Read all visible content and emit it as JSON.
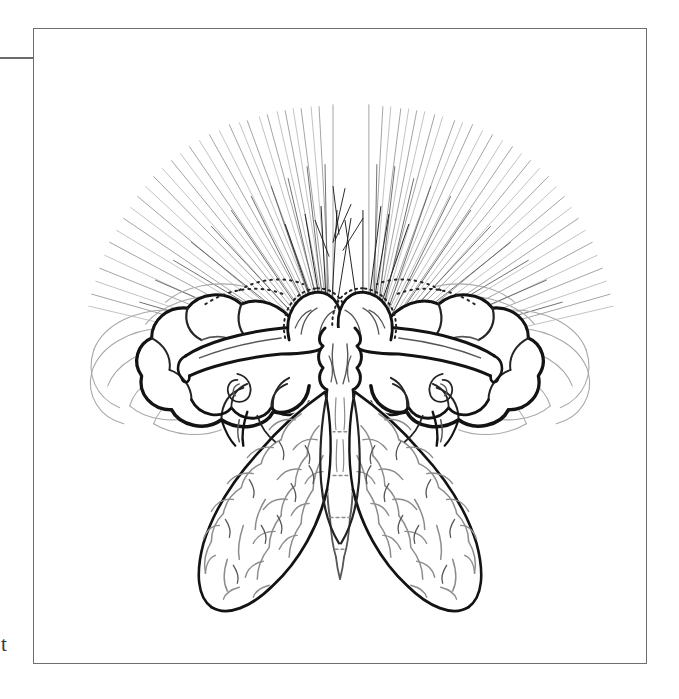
{
  "page": {
    "background_color": "#ffffff",
    "width": 679,
    "height": 699,
    "kind": "scanned-document-page"
  },
  "margin": {
    "rule_color": "#6b6b6b",
    "text_fragment": "t"
  },
  "figure": {
    "frame_color": "#6e6e6e",
    "frame_background": "#ffffff",
    "caption": "",
    "title": "",
    "ink_colors": {
      "heavy": "#131313",
      "mid": "#242424",
      "light": "#565656",
      "faint": "#8d8d8d",
      "wisp": "#a8a8a8"
    },
    "elements": [
      {
        "name": "radiating-rays",
        "description": "fine hatched rays fanning upward and outward from the two central domes"
      },
      {
        "name": "left-dome-head",
        "description": "rounded dome with stippled rim at upper centre-left"
      },
      {
        "name": "right-dome-head",
        "description": "rounded dome with stippled rim at upper centre-right"
      },
      {
        "name": "left-cloud-wing",
        "description": "scalloped cumulus-lobed upper wing extending to the left"
      },
      {
        "name": "right-cloud-wing",
        "description": "scalloped cumulus-lobed upper wing extending to the right"
      },
      {
        "name": "left-arm-bar",
        "description": "tapered horizontal limb crossing the left cloud wing"
      },
      {
        "name": "right-arm-bar",
        "description": "tapered horizontal limb crossing the right cloud wing"
      },
      {
        "name": "left-lower-wing",
        "description": "elongated bumpy cone-textured lower wing, lower left"
      },
      {
        "name": "right-lower-wing",
        "description": "elongated bumpy cone-textured lower wing, lower right"
      },
      {
        "name": "thorax",
        "description": "central lobed thorax between the two domes"
      },
      {
        "name": "abdomen",
        "description": "segmented tapering abdomen descending from the thorax"
      },
      {
        "name": "outer-wisps",
        "description": "faint sweeping arcs of vapour at the far left and right margins"
      }
    ]
  }
}
